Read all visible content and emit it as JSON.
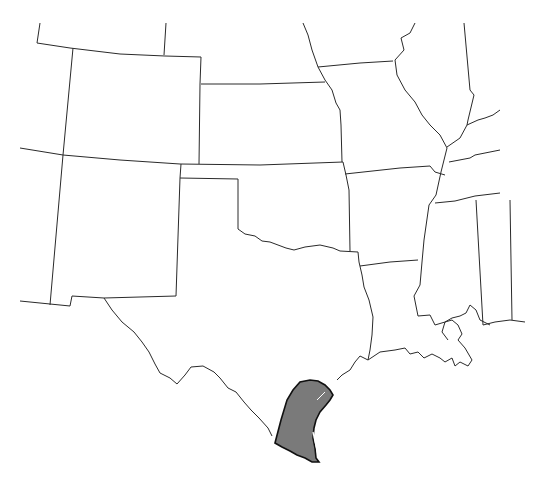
{
  "map": {
    "type": "range-map",
    "region": "South-central United States",
    "states_shown": [
      "Colorado",
      "Kansas",
      "Missouri",
      "Illinois",
      "Nebraska",
      "Wyoming",
      "New Mexico",
      "Oklahoma",
      "Arkansas",
      "Texas",
      "Louisiana",
      "Mississippi",
      "Tennessee",
      "Kentucky",
      "Arizona",
      "Utah"
    ],
    "highlighted_region": "South Texas coastal plain",
    "colors": {
      "background": "#ffffff",
      "border": "#2a2a2a",
      "range_fill": "#7a7a7a",
      "range_stroke": "#111111"
    }
  }
}
